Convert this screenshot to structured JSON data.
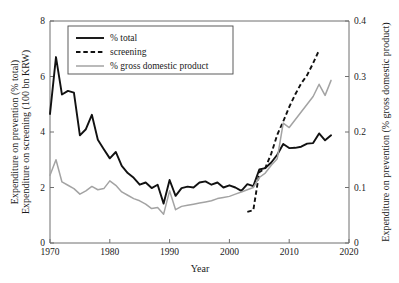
{
  "chart_data": {
    "type": "line",
    "title": "",
    "xlabel": "Year",
    "ylabel_left_line1": "Expenditure on prevention (% total)",
    "ylabel_left_line2": "Expenditure on screening (100 bn KRW)",
    "ylabel_right": "Expenditure on prevention (% gross domestic product)",
    "xlim": [
      1970,
      2020
    ],
    "ylim_left": [
      0,
      8
    ],
    "ylim_right": [
      0,
      0.4
    ],
    "xticks": [
      1970,
      1980,
      1990,
      2000,
      2010,
      2020
    ],
    "xtick_labels": [
      "1970",
      "1980",
      "1990",
      "2000",
      "2010",
      "2020"
    ],
    "yticks_left": [
      0,
      2,
      4,
      6,
      8
    ],
    "ytick_labels_left": [
      "0",
      "2",
      "4",
      "6",
      "8"
    ],
    "yticks_right": [
      0,
      0.1,
      0.2,
      0.3,
      0.4
    ],
    "ytick_labels_right": [
      "0",
      "0.1",
      "0.2",
      "0.3",
      "0.4"
    ],
    "grid": false,
    "legend_position": "top-left",
    "legend": [
      {
        "label": "% total",
        "style": "solid",
        "color": "#111111",
        "axis": "left"
      },
      {
        "label": "screening",
        "style": "dashed",
        "color": "#111111",
        "axis": "left"
      },
      {
        "label": "% gross domestic product",
        "style": "solid",
        "color": "#a3a3a3",
        "axis": "right"
      }
    ],
    "series": [
      {
        "name": "% total",
        "style": "solid",
        "color": "#111111",
        "axis": "left",
        "x": [
          1970,
          1971,
          1972,
          1973,
          1974,
          1975,
          1976,
          1977,
          1978,
          1979,
          1980,
          1981,
          1982,
          1983,
          1984,
          1985,
          1986,
          1987,
          1988,
          1989,
          1990,
          1991,
          1992,
          1993,
          1994,
          1995,
          1996,
          1997,
          1998,
          1999,
          2000,
          2001,
          2002,
          2003,
          2004,
          2005,
          2006,
          2007,
          2008,
          2009,
          2010,
          2011,
          2012,
          2013,
          2014,
          2015,
          2016,
          2017
        ],
        "values": [
          4.65,
          6.7,
          5.35,
          5.48,
          5.42,
          3.88,
          4.1,
          4.62,
          3.72,
          3.38,
          3.05,
          3.28,
          2.78,
          2.52,
          2.35,
          2.1,
          2.18,
          1.98,
          2.1,
          1.42,
          2.27,
          1.7,
          1.98,
          2.03,
          2.0,
          2.18,
          2.22,
          2.1,
          2.18,
          2.0,
          2.08,
          2.0,
          1.88,
          2.12,
          2.05,
          2.65,
          2.7,
          2.9,
          3.18,
          3.57,
          3.42,
          3.43,
          3.47,
          3.58,
          3.6,
          3.95,
          3.7,
          3.88
        ]
      },
      {
        "name": "screening",
        "style": "dashed",
        "color": "#111111",
        "axis": "left",
        "x": [
          2003,
          2004,
          2005,
          2006,
          2007,
          2008,
          2009,
          2010,
          2011,
          2012,
          2013,
          2014,
          2015
        ],
        "values": [
          1.12,
          1.18,
          2.55,
          2.7,
          3.22,
          3.9,
          4.38,
          4.9,
          5.35,
          5.75,
          6.05,
          6.48,
          6.95
        ]
      },
      {
        "name": "% gross domestic product",
        "style": "solid",
        "color": "#a3a3a3",
        "axis": "right",
        "x": [
          1970,
          1971,
          1972,
          1973,
          1974,
          1975,
          1976,
          1977,
          1978,
          1979,
          1980,
          1981,
          1982,
          1983,
          1984,
          1985,
          1986,
          1987,
          1988,
          1989,
          1990,
          1991,
          1992,
          1993,
          1994,
          1995,
          1996,
          1997,
          1998,
          1999,
          2000,
          2001,
          2002,
          2003,
          2004,
          2005,
          2006,
          2007,
          2008,
          2009,
          2010,
          2011,
          2012,
          2013,
          2014,
          2015,
          2016,
          2017
        ],
        "values": [
          0.122,
          0.15,
          0.11,
          0.104,
          0.098,
          0.088,
          0.094,
          0.102,
          0.096,
          0.098,
          0.112,
          0.104,
          0.092,
          0.086,
          0.08,
          0.076,
          0.07,
          0.062,
          0.064,
          0.052,
          0.094,
          0.06,
          0.066,
          0.068,
          0.07,
          0.072,
          0.074,
          0.076,
          0.08,
          0.082,
          0.084,
          0.088,
          0.092,
          0.096,
          0.1,
          0.118,
          0.126,
          0.14,
          0.152,
          0.216,
          0.208,
          0.222,
          0.236,
          0.25,
          0.264,
          0.286,
          0.266,
          0.293
        ]
      }
    ]
  }
}
